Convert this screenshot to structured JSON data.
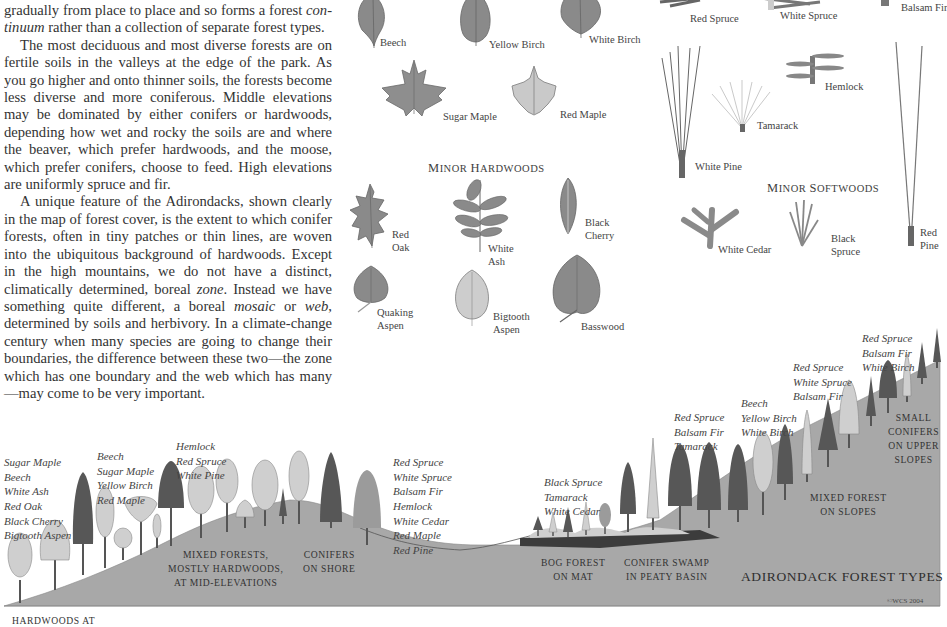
{
  "body_text": {
    "p1_a": "gradually from place to place and so forms a forest ",
    "p1_em": "con-tinuum",
    "p1_b": " rather than a collection of separate forest types.",
    "p2": "The most deciduous and most diverse forests are on fertile soils in the valleys at the edge of the park. As you go higher and onto thinner soils, the forests become less diverse and more coniferous. Middle elevations may be dominated by either conifers or hardwoods, depending how wet and rocky the soils are and where the beaver, which prefer hardwoods, and the moose, which prefer conifers, choose to feed. High elevations are uniformly spruce and fir.",
    "p3_a": "A unique feature of the Adirondacks, shown clearly in the map of forest cover, is the extent to which conifer forests, often in tiny patches or thin lines, are woven into the ubiquitous background of hardwoods. Except in the high mountains, we do not have a distinct, climatically determined, boreal ",
    "p3_em1": "zone",
    "p3_b": ". Instead we have something quite different, a boreal ",
    "p3_em2": "mosaic",
    "p3_c": " or ",
    "p3_em3": "web",
    "p3_d": ", determined by soils and herbivory. In a climate-change century when many species are going to change their boundaries, the difference between these two—the zone which has one boundary and the web which has many—may come to be very important."
  },
  "major_hardwoods": {
    "leaves": [
      {
        "name": "Beech"
      },
      {
        "name": "Yellow Birch"
      },
      {
        "name": "White Birch"
      },
      {
        "name": "Sugar Maple"
      },
      {
        "name": "Red Maple"
      }
    ]
  },
  "minor_hardwoods": {
    "heading_first": "M",
    "heading_rest": "inor ",
    "heading_first2": "H",
    "heading_rest2": "ardwoods",
    "leaves": [
      {
        "name": "Red\nOak"
      },
      {
        "name": "White\nAsh"
      },
      {
        "name": "Black\nCherry"
      },
      {
        "name": "Quaking\nAspen"
      },
      {
        "name": "Bigtooth\nAspen"
      },
      {
        "name": "Basswood"
      }
    ]
  },
  "major_softwoods": {
    "needles": [
      {
        "name": "Red Spruce"
      },
      {
        "name": "White Spruce"
      },
      {
        "name": "Balsam Fir"
      },
      {
        "name": "Hemlock"
      },
      {
        "name": "Tamarack"
      },
      {
        "name": "White Pine"
      },
      {
        "name": "Red\nPine"
      }
    ]
  },
  "minor_softwoods": {
    "heading_first": "M",
    "heading_rest": "inor ",
    "heading_first2": "S",
    "heading_rest2": "oftwoods",
    "needles": [
      {
        "name": "White Cedar"
      },
      {
        "name": "Black\nSpruce"
      }
    ]
  },
  "profile": {
    "species_groups": [
      {
        "id": "valley-hardwoods",
        "species": [
          "Sugar Maple",
          "Beech",
          "White Ash",
          "Red Oak",
          "Black Cherry",
          "Bigtooth Aspen"
        ]
      },
      {
        "id": "mid-hardwoods",
        "species": [
          "Beech",
          "Sugar Maple",
          "Yellow Birch",
          "Red Maple"
        ]
      },
      {
        "id": "mid-conifers",
        "species": [
          "Hemlock",
          "Red Spruce",
          "White Pine"
        ]
      },
      {
        "id": "shore-conifers",
        "species": [
          "Red Spruce",
          "White Spruce",
          "Balsam Fir",
          "Hemlock",
          "White Cedar",
          "Red Maple",
          "Red Pine"
        ]
      },
      {
        "id": "bog",
        "species": [
          "Black Spruce",
          "Tamarack",
          "White Cedar"
        ]
      },
      {
        "id": "swamp",
        "species": [
          "Red Spruce",
          "Balsam Fir",
          "Tamarack"
        ]
      },
      {
        "id": "slope-hardwoods",
        "species": [
          "Beech",
          "Yellow Birch",
          "White Birch"
        ]
      },
      {
        "id": "slope-conifers",
        "species": [
          "Red Spruce",
          "White Spruce",
          "Balsam Fir"
        ]
      },
      {
        "id": "upper",
        "species": [
          "Red Spruce",
          "Balsam Fir",
          "White Birch"
        ]
      }
    ],
    "zones": [
      {
        "id": "mixed-forests",
        "lines": [
          "Mixed Forests,",
          "Mostly Hardwoods,",
          "at Mid-Elevations"
        ]
      },
      {
        "id": "conifers-shore",
        "lines": [
          "Conifers",
          "on Shore"
        ]
      },
      {
        "id": "bog-forest",
        "lines": [
          "Bog Forest",
          "on Mat"
        ]
      },
      {
        "id": "conifer-swamp",
        "lines": [
          "Conifer Swamp",
          "in Peaty Basin"
        ]
      },
      {
        "id": "mixed-slopes",
        "lines": [
          "Mixed Forest",
          "on Slopes"
        ]
      },
      {
        "id": "small-conifers",
        "lines": [
          "Small",
          "Conifers",
          "on Upper",
          "Slopes"
        ]
      },
      {
        "id": "hardwoods-valley",
        "lines": [
          "Hardwoods at"
        ]
      }
    ],
    "title": "ADIRONDACK FOREST TYPES",
    "copyright": "©WCS 2004"
  },
  "colors": {
    "ground": "#a8a8a8",
    "hardwood_light": "#cfcfcf",
    "conifer_dark": "#575757",
    "tree_mid": "#9b9b9b",
    "leaf_dark": "#8a8a8a",
    "leaf_light": "#c9c9c9",
    "swamp_dark": "#3c3c3c"
  }
}
